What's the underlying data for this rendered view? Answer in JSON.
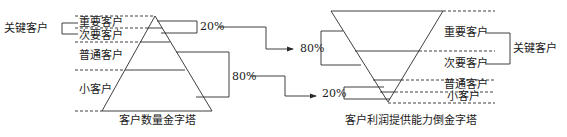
{
  "left_pyramid": {
    "title": "客户数量金字塔",
    "tiers": [
      "重要客户",
      "次要客户",
      "普通客户",
      "小客户"
    ],
    "group_label": "关键客户",
    "pct_top": "20%",
    "pct_bottom": "80%"
  },
  "right_pyramid": {
    "title": "客户利润提供能力倒金字塔",
    "tiers": [
      "重要客户",
      "次要客户",
      "普通客户",
      "小客户"
    ],
    "group_label": "关键客户",
    "pct_top": "80%",
    "pct_bottom": "20%"
  },
  "colors": {
    "line": "#2a2a2a",
    "background": "#ffffff"
  }
}
